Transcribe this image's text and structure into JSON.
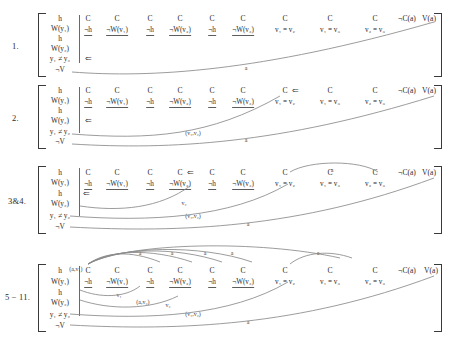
{
  "figure": {
    "background": "#ffffff",
    "ink": "#2b2b2b",
    "line_color": "#8a8a8a"
  },
  "columns": {
    "top_row": [
      "C",
      "C",
      "C",
      "C",
      "C",
      "C",
      "C",
      "C",
      "C",
      "¬C(a)",
      "V(a)"
    ],
    "bottom_row": [
      "¬h",
      "¬W(v₁)",
      "¬h",
      "¬W(v₂)",
      "¬h",
      "¬W(v₃)",
      "v₁ = v₂",
      "v₁ = v₃",
      "v₂ = v₃",
      "",
      ""
    ],
    "goal": [
      "h",
      "W(y₁)",
      "h",
      "W(y₂)",
      "y₁ ≠ y₂",
      "¬V"
    ]
  },
  "stages": [
    {
      "label": "1.",
      "arrow_marks": [
        {
          "row": 4,
          "col": -1,
          "glyph": "⇐"
        }
      ],
      "top_arrow_cols": [],
      "arc_labels": [
        {
          "text": "a"
        }
      ]
    },
    {
      "label": "2.",
      "arrow_marks": [
        {
          "row": 3,
          "col": -1,
          "glyph": "⇐"
        }
      ],
      "top_arrow_cols": [
        6
      ],
      "arc_labels": [
        {
          "text": "(v₁,v₂)"
        },
        {
          "text": "a"
        }
      ]
    },
    {
      "label": "3&4.",
      "arrow_marks": [
        {
          "row": 2,
          "col": -1,
          "glyph": "⇐"
        }
      ],
      "top_arrow_cols": [
        3
      ],
      "arc_labels": [
        {
          "text": "v₂"
        },
        {
          "text": "(v₁,v₂)"
        },
        {
          "text": "a"
        },
        {
          "text": "a"
        }
      ]
    },
    {
      "label": "5 − 11.",
      "arrow_marks": [],
      "top_arrow_cols": [],
      "arc_labels": [
        {
          "text": "(a,v₁)"
        },
        {
          "text": "(a,v₂)"
        },
        {
          "text": "v₁"
        },
        {
          "text": "v₂"
        },
        {
          "text": "(v₁,v₂)"
        },
        {
          "text": "a"
        },
        {
          "text": "a"
        },
        {
          "text": "a"
        },
        {
          "text": "a"
        },
        {
          "text": "a"
        },
        {
          "text": "a"
        }
      ]
    }
  ],
  "annotations": {
    "a": "a",
    "v1": "v₁",
    "v2": "v₂",
    "pair_v1v2": "(v₁,v₂)",
    "pair_av1": "(a,v₁)",
    "pair_av2": "(a,v₂)",
    "double_left_arrow": "⇐"
  }
}
